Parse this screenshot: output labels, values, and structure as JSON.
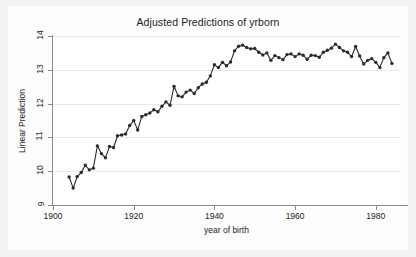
{
  "chart_data": {
    "type": "line",
    "title": "Adjusted Predictions of yrborn",
    "subtitle": "",
    "xlabel": "year of birth",
    "ylabel": "Linear Prediction",
    "xlim": [
      1900,
      1986
    ],
    "ylim": [
      9,
      14
    ],
    "xticks": [
      1900,
      1920,
      1940,
      1960,
      1980
    ],
    "yticks": [
      9,
      10,
      11,
      12,
      13,
      14
    ],
    "grid": "horizontal",
    "legend": "none",
    "marker": "filled-circle",
    "line_color": "#2b2b2b",
    "marker_color": "#2b2b2b",
    "series": [
      {
        "name": "Linear Prediction",
        "x": [
          1904,
          1905,
          1906,
          1907,
          1908,
          1909,
          1910,
          1911,
          1912,
          1913,
          1914,
          1915,
          1916,
          1917,
          1918,
          1919,
          1920,
          1921,
          1922,
          1923,
          1924,
          1925,
          1926,
          1927,
          1928,
          1929,
          1930,
          1931,
          1932,
          1933,
          1934,
          1935,
          1936,
          1937,
          1938,
          1939,
          1940,
          1941,
          1942,
          1943,
          1944,
          1945,
          1946,
          1947,
          1948,
          1949,
          1950,
          1951,
          1952,
          1953,
          1954,
          1955,
          1956,
          1957,
          1958,
          1959,
          1960,
          1961,
          1962,
          1963,
          1964,
          1965,
          1966,
          1967,
          1968,
          1969,
          1970,
          1971,
          1972,
          1973,
          1974,
          1975,
          1976,
          1977,
          1978,
          1979,
          1980,
          1981,
          1982,
          1983,
          1984
        ],
        "values": [
          9.83,
          9.5,
          9.84,
          9.96,
          10.18,
          10.04,
          10.09,
          10.75,
          10.52,
          10.4,
          10.73,
          10.7,
          11.05,
          11.07,
          11.1,
          11.35,
          11.5,
          11.22,
          11.62,
          11.67,
          11.72,
          11.82,
          11.76,
          11.92,
          12.05,
          11.95,
          12.51,
          12.23,
          12.2,
          12.34,
          12.4,
          12.3,
          12.47,
          12.58,
          12.63,
          12.82,
          13.15,
          13.07,
          13.22,
          13.12,
          13.23,
          13.56,
          13.7,
          13.73,
          13.66,
          13.62,
          13.63,
          13.52,
          13.44,
          13.5,
          13.28,
          13.42,
          13.36,
          13.3,
          13.45,
          13.47,
          13.39,
          13.47,
          13.43,
          13.31,
          13.43,
          13.42,
          13.37,
          13.52,
          13.58,
          13.64,
          13.76,
          13.66,
          13.56,
          13.52,
          13.39,
          13.69,
          13.41,
          13.17,
          13.28,
          13.33,
          13.22,
          13.07,
          13.36,
          13.5,
          13.19
        ]
      }
    ]
  }
}
